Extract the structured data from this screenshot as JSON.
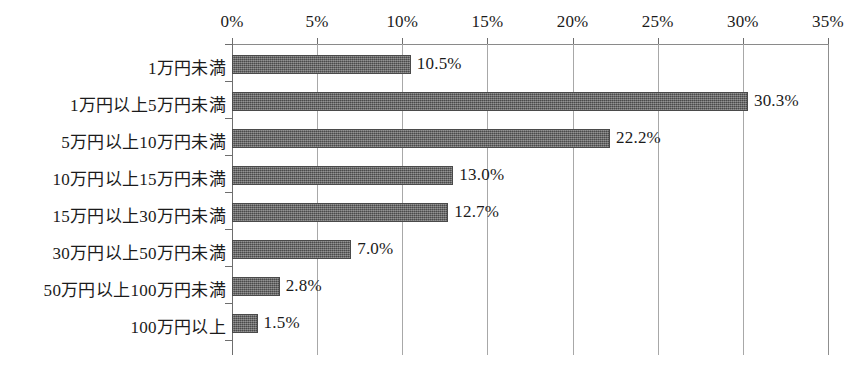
{
  "chart_data": {
    "type": "bar",
    "orientation": "horizontal",
    "title": "",
    "subtitle": "",
    "xlabel": "",
    "ylabel": "",
    "xlim": [
      0,
      35
    ],
    "xtick_labels": [
      "0%",
      "5%",
      "10%",
      "15%",
      "20%",
      "25%",
      "30%",
      "35%"
    ],
    "xticks": [
      0,
      5,
      10,
      15,
      20,
      25,
      30,
      35
    ],
    "grid": true,
    "legend": false,
    "legend_position": "none",
    "categories": [
      "1万円未満",
      "1万円以上5万円未満",
      "5万円以上10万円未満",
      "10万円以上15万円未満",
      "15万円以上30万円未満",
      "30万円以上50万円未満",
      "50万円以上100万円未満",
      "100万円以上"
    ],
    "values": [
      10.5,
      30.3,
      22.2,
      13.0,
      12.7,
      7.0,
      2.8,
      1.5
    ],
    "value_labels": [
      "10.5%",
      "30.3%",
      "22.2%",
      "13.0%",
      "12.7%",
      "7.0%",
      "2.8%",
      "1.5%"
    ],
    "bar_color": "#5e5e5e",
    "background_color": "#ffffff",
    "axis_color": "#6e6e6e",
    "grid_color": "#a8a8a8"
  }
}
